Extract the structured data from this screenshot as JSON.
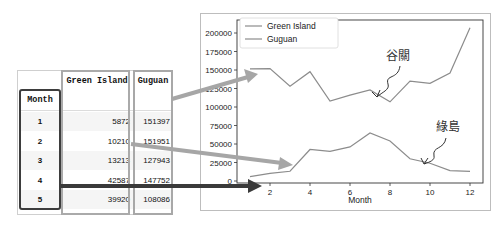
{
  "table": {
    "columns": [
      "Green Island",
      "Guguan"
    ],
    "index_label": "Month",
    "rows": [
      {
        "month": "1",
        "green_island": "5872",
        "guguan": "151397"
      },
      {
        "month": "2",
        "green_island": "10210",
        "guguan": "151951"
      },
      {
        "month": "3",
        "green_island": "13213",
        "guguan": "127943"
      },
      {
        "month": "4",
        "green_island": "42587",
        "guguan": "147752"
      },
      {
        "month": "5",
        "green_island": "39920",
        "guguan": "108086"
      }
    ]
  },
  "annotations": {
    "guguan_label": "谷關",
    "green_island_label": "綠島"
  },
  "colors": {
    "line": "#8c8c8c",
    "arrow_light": "#a6a6a6",
    "arrow_dark": "#3a3a3a",
    "axis": "#333333"
  },
  "chart_data": {
    "type": "line",
    "title": "",
    "xlabel": "Month",
    "ylabel": "",
    "x": [
      1,
      2,
      3,
      4,
      5,
      6,
      7,
      8,
      9,
      10,
      11,
      12
    ],
    "xlim": [
      0.4,
      12.6
    ],
    "ylim": [
      -3000,
      215000
    ],
    "xticks": [
      2,
      4,
      6,
      8,
      10,
      12
    ],
    "yticks": [
      0,
      25000,
      50000,
      75000,
      100000,
      125000,
      150000,
      175000,
      200000
    ],
    "grid": false,
    "legend": "top-left",
    "series": [
      {
        "name": "Green Island",
        "values": [
          5872,
          10210,
          13213,
          42587,
          39920,
          46000,
          65000,
          54000,
          30000,
          24000,
          14000,
          13000
        ]
      },
      {
        "name": "Guguan",
        "values": [
          151397,
          151951,
          127943,
          147752,
          108086,
          116000,
          123000,
          107000,
          135000,
          132000,
          146000,
          207000
        ]
      }
    ]
  }
}
